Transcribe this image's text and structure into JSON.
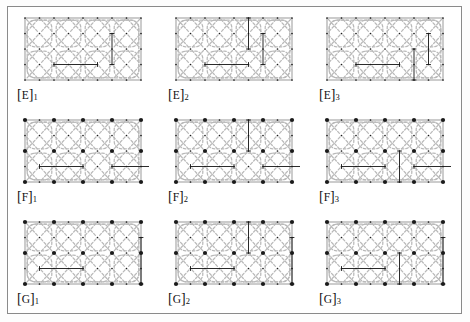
{
  "figure": {
    "frame_color": "#8a8a8a",
    "background_color": "#ffffff",
    "curve_color": "#b9b9b9",
    "dot_color": "#1a1a1a",
    "chord_color": "#2b2b2b",
    "rows": 3,
    "columns": 3
  },
  "panels": [
    {
      "id": "E1",
      "label_bracket_open": "[",
      "label_letter": "E",
      "label_bracket_close": "]",
      "label_subscript": "1",
      "family": "E",
      "index": "1",
      "lattice_columns": 9,
      "lattice_rows": 5,
      "big_dots": false,
      "border": true,
      "chords": [
        {
          "type": "horizontal",
          "x1": 2,
          "x2": 5,
          "y": 4
        },
        {
          "type": "vertical",
          "x": 6,
          "y1": 1,
          "y2": 3
        }
      ]
    },
    {
      "id": "E2",
      "label_bracket_open": "[",
      "label_letter": "E",
      "label_bracket_close": "]",
      "label_subscript": "2",
      "family": "E",
      "index": "2",
      "lattice_columns": 9,
      "lattice_rows": 5,
      "big_dots": false,
      "border": true,
      "chords": [
        {
          "type": "horizontal",
          "x1": 2,
          "x2": 5,
          "y": 4
        },
        {
          "type": "vertical",
          "x": 5,
          "y1": 0,
          "y2": 2
        },
        {
          "type": "vertical",
          "x": 6,
          "y1": 1,
          "y2": 3
        }
      ]
    },
    {
      "id": "E3",
      "label_bracket_open": "[",
      "label_letter": "E",
      "label_bracket_close": "]",
      "label_subscript": "3",
      "family": "E",
      "index": "3",
      "lattice_columns": 9,
      "lattice_rows": 5,
      "big_dots": false,
      "border": true,
      "chords": [
        {
          "type": "horizontal",
          "x1": 2,
          "x2": 5,
          "y": 4
        },
        {
          "type": "vertical",
          "x": 6,
          "y1": 2,
          "y2": 4
        },
        {
          "type": "vertical",
          "x": 7,
          "y1": 1,
          "y2": 3
        }
      ]
    },
    {
      "id": "F1",
      "label_bracket_open": "[",
      "label_letter": "F",
      "label_bracket_close": "]",
      "label_subscript": "1",
      "family": "F",
      "index": "1",
      "lattice_columns": 9,
      "lattice_rows": 5,
      "big_dots": true,
      "border": true,
      "chords": [
        {
          "type": "horizontal",
          "x1": 1,
          "x2": 4,
          "y": 4
        },
        {
          "type": "horizontal",
          "x1": 6,
          "x2": 9,
          "y": 4
        }
      ]
    },
    {
      "id": "F2",
      "label_bracket_open": "[",
      "label_letter": "F",
      "label_bracket_close": "]",
      "label_subscript": "2",
      "family": "F",
      "index": "2",
      "lattice_columns": 9,
      "lattice_rows": 5,
      "big_dots": true,
      "border": true,
      "chords": [
        {
          "type": "horizontal",
          "x1": 1,
          "x2": 4,
          "y": 4
        },
        {
          "type": "horizontal",
          "x1": 6,
          "x2": 9,
          "y": 4
        },
        {
          "type": "vertical",
          "x": 5,
          "y1": 0,
          "y2": 2
        }
      ]
    },
    {
      "id": "F3",
      "label_bracket_open": "[",
      "label_letter": "F",
      "label_bracket_close": "]",
      "label_subscript": "3",
      "family": "F",
      "index": "3",
      "lattice_columns": 9,
      "lattice_rows": 5,
      "big_dots": true,
      "border": true,
      "chords": [
        {
          "type": "horizontal",
          "x1": 1,
          "x2": 4,
          "y": 4
        },
        {
          "type": "horizontal",
          "x1": 6,
          "x2": 9,
          "y": 4
        },
        {
          "type": "vertical",
          "x": 5,
          "y1": 2,
          "y2": 4
        }
      ]
    },
    {
      "id": "G1",
      "label_bracket_open": "[",
      "label_letter": "G",
      "label_bracket_close": "]",
      "label_subscript": "1",
      "family": "G",
      "index": "1",
      "lattice_columns": 9,
      "lattice_rows": 5,
      "big_dots": true,
      "border": true,
      "chords": [
        {
          "type": "horizontal",
          "x1": 1,
          "x2": 4,
          "y": 4
        },
        {
          "type": "vertical",
          "x": 8,
          "y1": 1,
          "y2": 4
        }
      ]
    },
    {
      "id": "G2",
      "label_bracket_open": "[",
      "label_letter": "G",
      "label_bracket_close": "]",
      "label_subscript": "2",
      "family": "G",
      "index": "2",
      "lattice_columns": 9,
      "lattice_rows": 5,
      "big_dots": true,
      "border": true,
      "chords": [
        {
          "type": "horizontal",
          "x1": 1,
          "x2": 4,
          "y": 4
        },
        {
          "type": "vertical",
          "x": 5,
          "y1": 0,
          "y2": 2
        },
        {
          "type": "vertical",
          "x": 8,
          "y1": 1,
          "y2": 4
        }
      ]
    },
    {
      "id": "G3",
      "label_bracket_open": "[",
      "label_letter": "G",
      "label_bracket_close": "]",
      "label_subscript": "3",
      "family": "G",
      "index": "3",
      "lattice_columns": 9,
      "lattice_rows": 5,
      "big_dots": true,
      "border": true,
      "chords": [
        {
          "type": "horizontal",
          "x1": 1,
          "x2": 4,
          "y": 4
        },
        {
          "type": "vertical",
          "x": 5,
          "y1": 2,
          "y2": 4
        },
        {
          "type": "vertical",
          "x": 8,
          "y1": 1,
          "y2": 4
        }
      ]
    }
  ]
}
